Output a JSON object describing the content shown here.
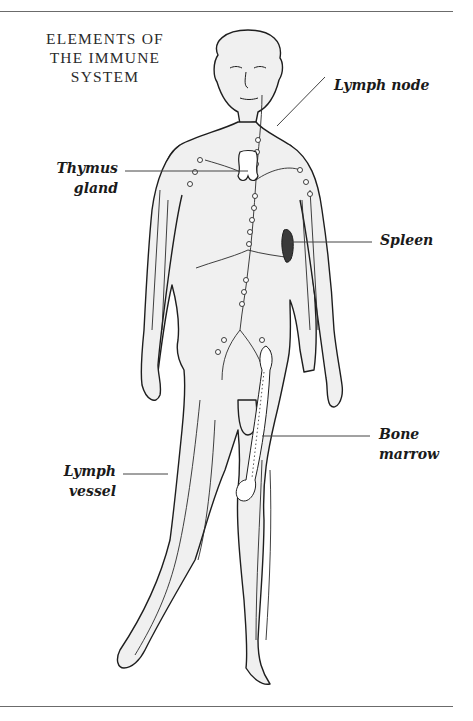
{
  "diagram": {
    "title_lines": [
      "ELEMENTS OF",
      "THE IMMUNE",
      "SYSTEM"
    ],
    "labels": {
      "lymph_node": "Lymph node",
      "thymus_line1": "Thymus",
      "thymus_line2": "gland",
      "spleen": "Spleen",
      "bone_marrow_line1": "Bone",
      "bone_marrow_line2": "marrow",
      "lymph_vessel_line1": "Lymph",
      "lymph_vessel_line2": "vessel"
    },
    "colors": {
      "outline": "#1e1e1e",
      "skin_shade": "#eeeeee",
      "leader_line": "#444444",
      "spleen": "#3a3a3a"
    }
  }
}
